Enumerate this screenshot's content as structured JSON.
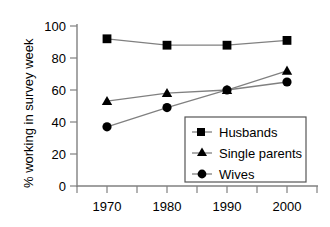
{
  "chart_data": {
    "type": "line",
    "title": "",
    "xlabel": "",
    "ylabel": "% working in survey week",
    "categories": [
      "1970",
      "1980",
      "1990",
      "2000"
    ],
    "x": [
      1970,
      1980,
      1990,
      2000
    ],
    "xlim": [
      1965,
      2005
    ],
    "ylim": [
      0,
      100
    ],
    "ytick_labels": [
      "0",
      "20",
      "40",
      "60",
      "80",
      "100"
    ],
    "yticks": [
      0,
      20,
      40,
      60,
      80,
      100
    ],
    "grid": false,
    "legend_position": "lower right",
    "series": [
      {
        "name": "Husbands",
        "marker": "square",
        "color": "#000000",
        "values": [
          92,
          88,
          88,
          91
        ]
      },
      {
        "name": "Single parents",
        "marker": "triangle",
        "color": "#000000",
        "values": [
          53,
          58,
          60,
          72
        ]
      },
      {
        "name": "Wives",
        "marker": "circle",
        "color": "#000000",
        "values": [
          37,
          49,
          60,
          65
        ]
      }
    ]
  },
  "legend": {
    "entries": [
      {
        "label": "Husbands",
        "marker": "square-marker-icon"
      },
      {
        "label": "Single parents",
        "marker": "triangle-marker-icon"
      },
      {
        "label": "Wives",
        "marker": "circle-marker-icon"
      }
    ]
  },
  "axes": {
    "y_title": "% working in survey week",
    "y_ticks": [
      "100",
      "80",
      "60",
      "40",
      "20",
      "0"
    ],
    "x_ticks": [
      "1970",
      "1980",
      "1990",
      "2000"
    ]
  },
  "colors": {
    "axis": "#808080",
    "line": "#808080",
    "marker": "#000000",
    "text": "#000000",
    "background": "#ffffff"
  }
}
